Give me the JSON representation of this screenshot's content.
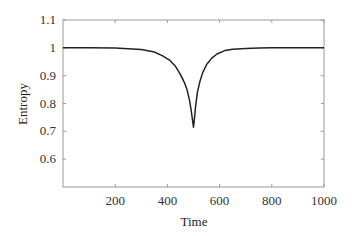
{
  "chart_data": {
    "type": "line",
    "title": "",
    "xlabel": "Time",
    "ylabel": "Entropy",
    "xlim": [
      0,
      1000
    ],
    "ylim": [
      0.5,
      1.1
    ],
    "xticks": [
      200,
      400,
      600,
      800,
      1000
    ],
    "xtick_labels": [
      "200",
      "400",
      "600",
      "800",
      "1000"
    ],
    "yticks": [
      0.6,
      0.7,
      0.8,
      0.9,
      1.0,
      1.1
    ],
    "ytick_labels": [
      "0.6",
      "0.7",
      "0.8",
      "0.9",
      "1",
      "1.1"
    ],
    "grid": false,
    "legend": null,
    "series": [
      {
        "name": "Entropy",
        "color": "#222222",
        "x": [
          0,
          100,
          200,
          250,
          300,
          350,
          380,
          410,
          430,
          450,
          465,
          475,
          485,
          492,
          497,
          500,
          503,
          508,
          515,
          525,
          535,
          550,
          570,
          590,
          620,
          650,
          700,
          750,
          800,
          900,
          1000
        ],
        "y": [
          1.0,
          1.0,
          0.999,
          0.997,
          0.994,
          0.985,
          0.972,
          0.955,
          0.935,
          0.905,
          0.875,
          0.85,
          0.81,
          0.77,
          0.735,
          0.715,
          0.74,
          0.79,
          0.84,
          0.88,
          0.91,
          0.94,
          0.963,
          0.978,
          0.99,
          0.995,
          0.998,
          0.999,
          1.0,
          1.0,
          1.0
        ]
      }
    ]
  }
}
